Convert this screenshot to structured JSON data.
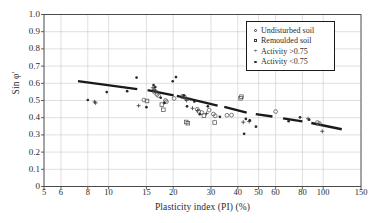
{
  "chart_data": {
    "type": "scatter",
    "title": "",
    "xlabel": "Plasticity index (PI) (%)",
    "ylabel": "Sin φ'",
    "xscale": "log",
    "xlim": [
      5,
      150
    ],
    "ylim": [
      0,
      1.0
    ],
    "grid": true,
    "legend_position": "top-right",
    "xticks": [
      5,
      6,
      8,
      10,
      15,
      20,
      30,
      40,
      50,
      60,
      80,
      100,
      150
    ],
    "xtick_labels": [
      "5",
      "6",
      "8",
      "10",
      "15",
      "20",
      "30",
      "40",
      "50",
      "60",
      "80",
      "100",
      "150"
    ],
    "yticks": [
      0,
      0.1,
      0.2,
      0.3,
      0.4,
      0.5,
      0.6,
      0.7,
      0.8,
      0.9,
      1.0
    ],
    "ytick_labels": [
      "0",
      "0.1",
      "0.2",
      "0.3",
      "0.4",
      "0.5",
      "0.6",
      "0.7",
      "0.8",
      "0.9",
      "1.0"
    ],
    "legend": [
      {
        "label": "Undisturbed soil",
        "marker": "open-circle"
      },
      {
        "label": "Remoulded soil",
        "marker": "open-square"
      },
      {
        "label": "Activity >0.75",
        "marker": "plus"
      },
      {
        "label": "Activity <0.75",
        "marker": "filled-dot"
      }
    ],
    "trend_line": {
      "style": "dashed-thick",
      "color": "#1a1a1a",
      "points": [
        [
          7.2,
          0.613
        ],
        [
          12.3,
          0.572
        ],
        [
          13.6,
          0.566
        ],
        [
          19.0,
          0.534
        ],
        [
          20.1,
          0.53
        ],
        [
          30.0,
          0.478
        ],
        [
          32.2,
          0.47
        ],
        [
          42.0,
          0.436
        ],
        [
          44.0,
          0.43
        ],
        [
          52.0,
          0.416
        ],
        [
          58.0,
          0.407
        ],
        [
          76.0,
          0.382
        ],
        [
          80.0,
          0.379
        ],
        [
          122.0,
          0.333
        ]
      ],
      "segments": [
        [
          [
            7.2,
            0.613
          ],
          [
            13.6,
            0.566
          ]
        ],
        [
          [
            15.2,
            0.56
          ],
          [
            20.1,
            0.53
          ]
        ],
        [
          [
            20.8,
            0.527
          ],
          [
            32.2,
            0.47
          ]
        ],
        [
          [
            34.6,
            0.463
          ],
          [
            44.0,
            0.43
          ]
        ],
        [
          [
            48.5,
            0.421
          ],
          [
            58.0,
            0.407
          ]
        ],
        [
          [
            65.0,
            0.396
          ],
          [
            80.0,
            0.379
          ]
        ],
        [
          [
            88.0,
            0.369
          ],
          [
            122.0,
            0.333
          ]
        ]
      ]
    },
    "series": [
      {
        "name": "Undisturbed soil",
        "marker": "open-circle",
        "points": [
          [
            14.6,
            0.503
          ],
          [
            16.4,
            0.548
          ],
          [
            16.8,
            0.535
          ],
          [
            17.1,
            0.528
          ],
          [
            18.4,
            0.5
          ],
          [
            18.6,
            0.493
          ],
          [
            20.2,
            0.512
          ],
          [
            22.6,
            0.52
          ],
          [
            25.9,
            0.449
          ],
          [
            26.3,
            0.437
          ],
          [
            27.2,
            0.43
          ],
          [
            29.4,
            0.444
          ],
          [
            30.8,
            0.421
          ],
          [
            31.4,
            0.411
          ],
          [
            35.6,
            0.414
          ],
          [
            37.4,
            0.415
          ],
          [
            60.0,
            0.436
          ],
          [
            94.0,
            0.372
          ],
          [
            96.0,
            0.366
          ]
        ]
      },
      {
        "name": "Remoulded soil",
        "marker": "open-square",
        "points": [
          [
            15.1,
            0.497
          ],
          [
            17.7,
            0.476
          ],
          [
            18.0,
            0.446
          ],
          [
            22.2,
            0.523
          ],
          [
            23.0,
            0.375
          ],
          [
            23.4,
            0.368
          ],
          [
            27.8,
            0.412
          ],
          [
            31.2,
            0.372
          ],
          [
            41.2,
            0.513
          ],
          [
            41.6,
            0.522
          ]
        ]
      },
      {
        "name": "Activity >0.75",
        "marker": "plus",
        "points": [
          [
            8.6,
            0.492
          ],
          [
            8.7,
            0.486
          ],
          [
            13.8,
            0.47
          ],
          [
            16.1,
            0.574
          ],
          [
            16.3,
            0.565
          ],
          [
            16.6,
            0.556
          ],
          [
            22.8,
            0.51
          ],
          [
            23.1,
            0.5
          ],
          [
            24.6,
            0.455
          ],
          [
            26.0,
            0.442
          ],
          [
            28.6,
            0.424
          ],
          [
            42.4,
            0.374
          ],
          [
            45.2,
            0.378
          ],
          [
            85.0,
            0.394
          ],
          [
            99.0,
            0.321
          ]
        ]
      },
      {
        "name": "Activity <0.75",
        "marker": "filled-dot",
        "points": [
          [
            8.0,
            0.503
          ],
          [
            9.8,
            0.549
          ],
          [
            12.2,
            0.554
          ],
          [
            13.5,
            0.633
          ],
          [
            15.0,
            0.461
          ],
          [
            16.2,
            0.59
          ],
          [
            16.5,
            0.578
          ],
          [
            17.5,
            0.516
          ],
          [
            18.2,
            0.486
          ],
          [
            19.9,
            0.612
          ],
          [
            20.6,
            0.636
          ],
          [
            22.4,
            0.53
          ],
          [
            23.2,
            0.466
          ],
          [
            24.0,
            0.508
          ],
          [
            25.1,
            0.494
          ],
          [
            26.6,
            0.42
          ],
          [
            29.0,
            0.466
          ],
          [
            33.0,
            0.405
          ],
          [
            42.8,
            0.306
          ],
          [
            43.6,
            0.393
          ],
          [
            45.5,
            0.385
          ],
          [
            48.6,
            0.348
          ],
          [
            69.0,
            0.38
          ],
          [
            78.0,
            0.402
          ],
          [
            86.0,
            0.388
          ]
        ]
      }
    ]
  }
}
